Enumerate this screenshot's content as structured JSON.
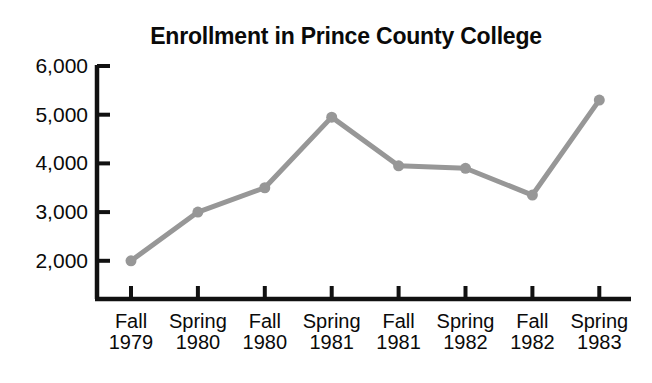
{
  "chart_data": {
    "type": "line",
    "title": "Enrollment in Prince County College",
    "xlabel": "",
    "ylabel": "",
    "categories": [
      "Fall 1979",
      "Spring 1980",
      "Fall 1980",
      "Spring 1981",
      "Fall 1981",
      "Spring 1982",
      "Fall 1982",
      "Spring 1983"
    ],
    "category_parts": [
      {
        "season": "Fall",
        "year": "1979"
      },
      {
        "season": "Spring",
        "year": "1980"
      },
      {
        "season": "Fall",
        "year": "1980"
      },
      {
        "season": "Spring",
        "year": "1981"
      },
      {
        "season": "Fall",
        "year": "1981"
      },
      {
        "season": "Spring",
        "year": "1982"
      },
      {
        "season": "Fall",
        "year": "1982"
      },
      {
        "season": "Spring",
        "year": "1983"
      }
    ],
    "values": [
      2000,
      3000,
      3500,
      4950,
      3950,
      3900,
      3350,
      5300
    ],
    "ylim": [
      1000,
      6000
    ],
    "yticks": [
      2000,
      3000,
      4000,
      5000,
      6000
    ],
    "ytick_labels": [
      "2,000",
      "3,000",
      "4,000",
      "5,000",
      "6,000"
    ],
    "grid": false,
    "legend": false,
    "series_color": "#979797",
    "axis_color": "#111111",
    "marker": "circle"
  },
  "top_artifact": {
    "text": " "
  }
}
